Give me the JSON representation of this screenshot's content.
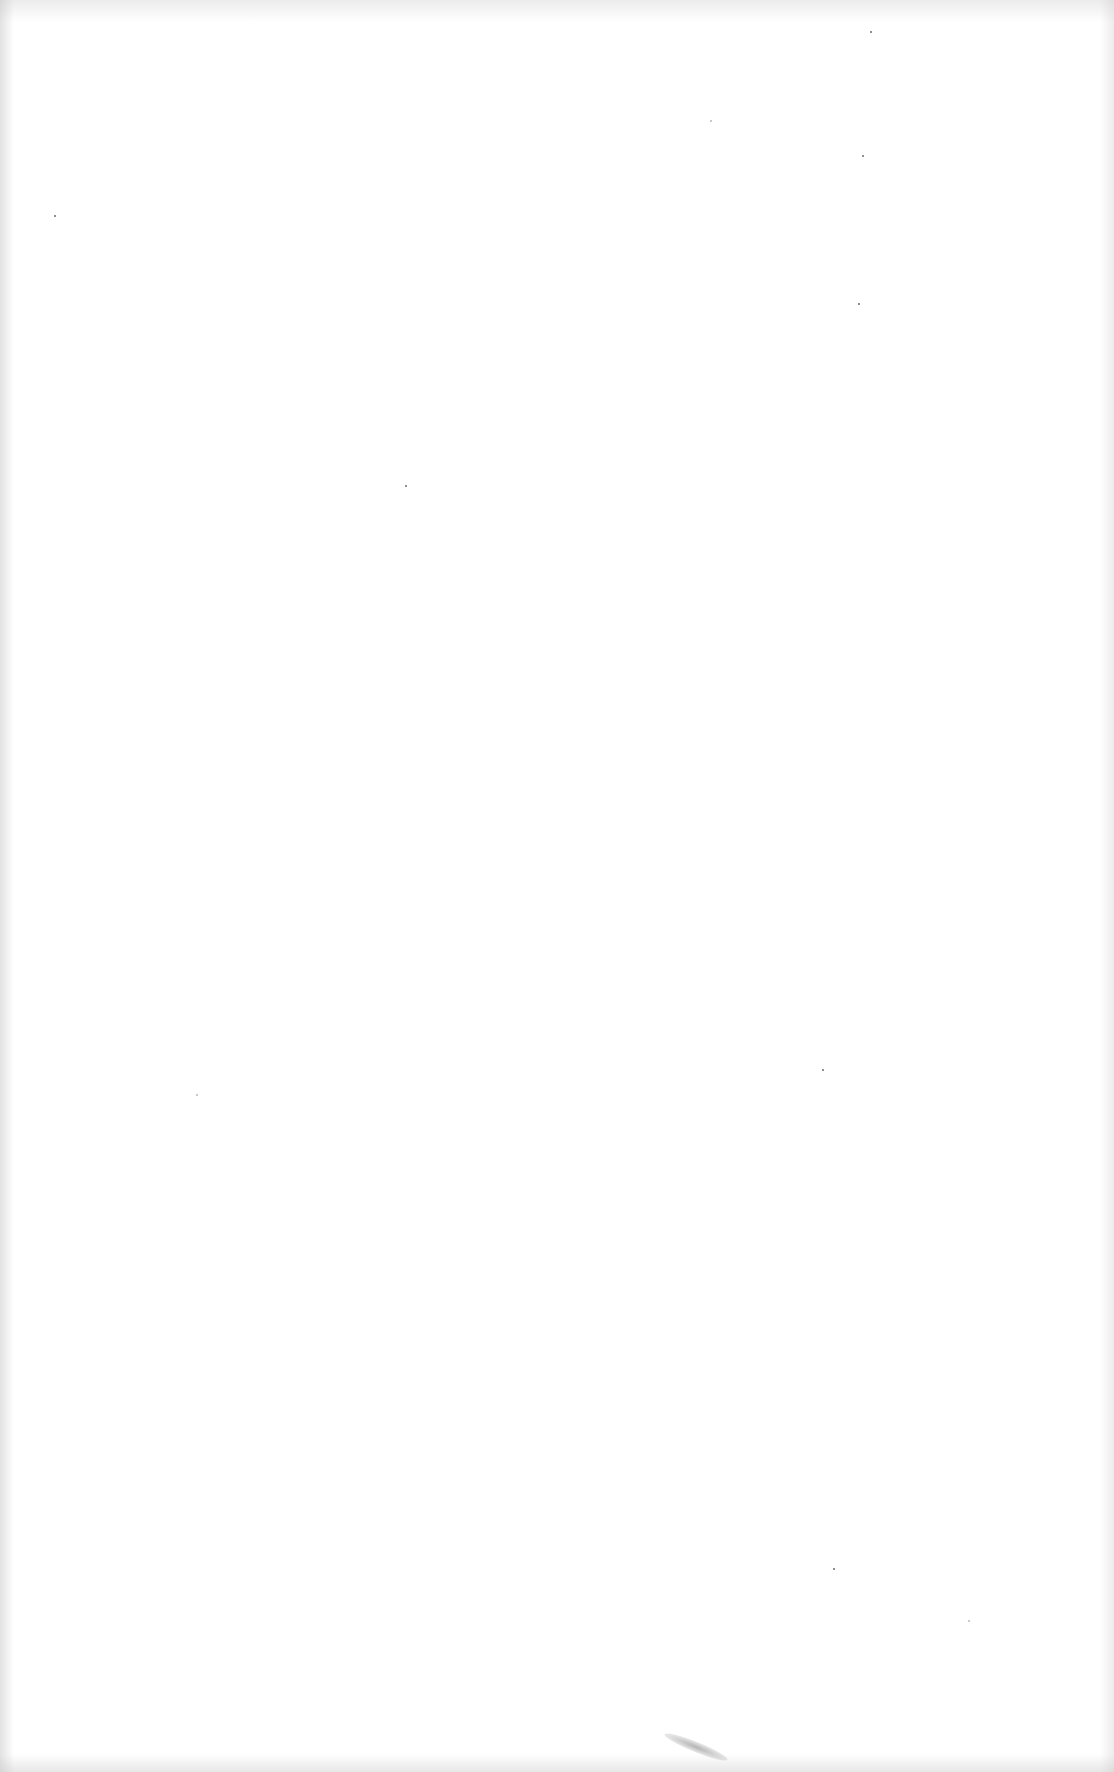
{
  "page": {
    "type": "blank-scanned-page",
    "background_color": "#ffffff",
    "edge_tint_color": "#c8c8c8",
    "artifacts": {
      "specks": [
        {
          "x": 870,
          "y": 31
        },
        {
          "x": 862,
          "y": 155
        },
        {
          "x": 196,
          "y": 1094
        },
        {
          "x": 822,
          "y": 1069
        },
        {
          "x": 833,
          "y": 1568
        },
        {
          "x": 968,
          "y": 1620
        },
        {
          "x": 54,
          "y": 215
        },
        {
          "x": 405,
          "y": 485
        },
        {
          "x": 710,
          "y": 120
        },
        {
          "x": 858,
          "y": 303
        }
      ],
      "smudge": {
        "x": 662,
        "y": 1742
      }
    }
  }
}
